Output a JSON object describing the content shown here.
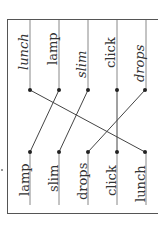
{
  "exercise": {
    "top_words": [
      "lunch",
      "lamp",
      "slim",
      "click",
      "drops"
    ],
    "bottom_words": [
      "lamp",
      "slim",
      "drops",
      "click",
      "lunch"
    ],
    "matches": [
      {
        "from": "lunch",
        "to": "lunch"
      },
      {
        "from": "lamp",
        "to": "lamp"
      },
      {
        "from": "slim",
        "to": "slim"
      },
      {
        "from": "click",
        "to": "click"
      },
      {
        "from": "drops",
        "to": "drops"
      }
    ],
    "line_color": "#444444"
  }
}
